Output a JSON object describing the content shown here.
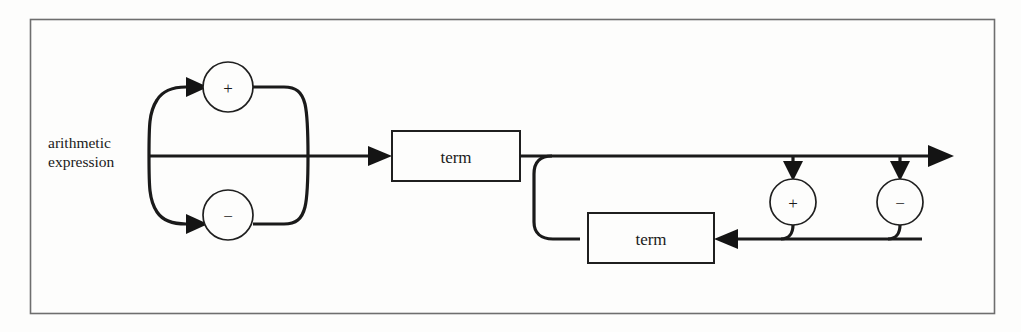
{
  "diagram": {
    "kind": "railroad-syntax-diagram",
    "rule_name_lines": [
      "arithmetic",
      "expression"
    ],
    "stroke_color": "#1a1a1a",
    "frame_color": "#6e6e6e",
    "background_color": "#fdfdfc",
    "nodes": {
      "sign_plus": {
        "label": "+",
        "shape": "circle",
        "cx": 228,
        "cy": 87,
        "r": 25
      },
      "sign_minus": {
        "label": "−",
        "shape": "circle",
        "cx": 228,
        "cy": 215,
        "r": 25
      },
      "term_first": {
        "label": "term",
        "shape": "box",
        "x": 392,
        "y": 131,
        "w": 128,
        "h": 50
      },
      "term_repeat": {
        "label": "term",
        "shape": "box",
        "x": 588,
        "y": 213,
        "w": 126,
        "h": 50
      },
      "op_plus": {
        "label": "+",
        "shape": "circle",
        "cx": 793,
        "cy": 202,
        "r": 23
      },
      "op_minus": {
        "label": "−",
        "shape": "circle",
        "cx": 900,
        "cy": 202,
        "r": 23
      }
    },
    "main_line_y": 156,
    "entry_x": 149,
    "exit_arrow_x": 950
  }
}
